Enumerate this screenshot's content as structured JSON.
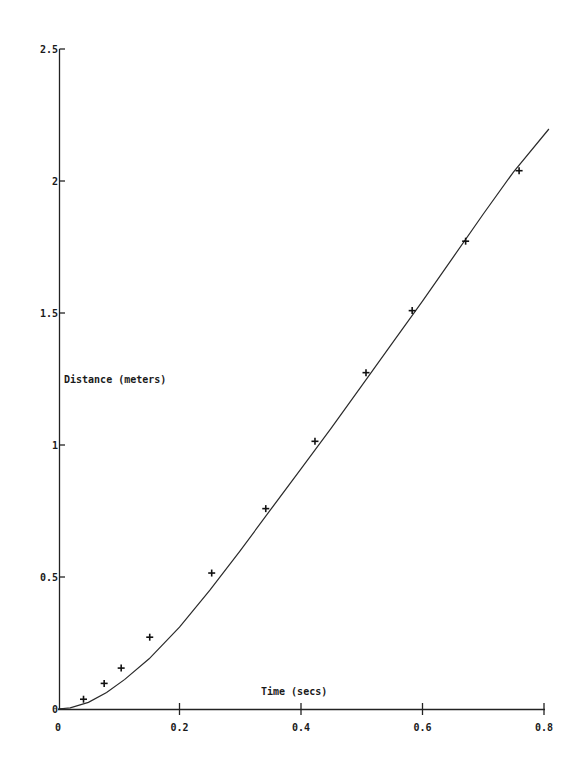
{
  "chart_data": {
    "type": "scatter",
    "title": "",
    "xlabel": "Time (secs)",
    "ylabel": "Distance (meters)",
    "xlim": [
      0,
      0.8
    ],
    "ylim": [
      0,
      2.5
    ],
    "grid": false,
    "legend": null,
    "x_ticks": [
      "0",
      "0.2",
      "0.4",
      "0.6",
      "0.8"
    ],
    "x_tick_values": [
      0,
      0.2,
      0.4,
      0.6,
      0.8
    ],
    "y_ticks": [
      "0",
      "0.5",
      "1",
      "1.5",
      "2",
      "2.5"
    ],
    "y_tick_values": [
      0,
      0.5,
      1,
      1.5,
      2,
      2.5
    ],
    "series": [
      {
        "name": "measured",
        "style": "plus-markers",
        "x": [
          0.042,
          0.076,
          0.104,
          0.151,
          0.253,
          0.342,
          0.423,
          0.507,
          0.583,
          0.671,
          0.759
        ],
        "y": [
          0.037,
          0.097,
          0.155,
          0.272,
          0.515,
          0.759,
          1.014,
          1.274,
          1.509,
          1.772,
          2.039
        ]
      },
      {
        "name": "model fit",
        "style": "line",
        "x": [
          0,
          0.02,
          0.05,
          0.08,
          0.11,
          0.15,
          0.2,
          0.25,
          0.3,
          0.35,
          0.4,
          0.45,
          0.5,
          0.55,
          0.6,
          0.65,
          0.7,
          0.75,
          0.808
        ],
        "y": [
          0,
          0.004,
          0.025,
          0.062,
          0.112,
          0.19,
          0.31,
          0.45,
          0.6,
          0.755,
          0.91,
          1.065,
          1.225,
          1.385,
          1.545,
          1.71,
          1.875,
          2.035,
          2.197
        ]
      }
    ]
  },
  "labels": {
    "xlabel": "Time (secs)",
    "ylabel": "Distance (meters)"
  }
}
